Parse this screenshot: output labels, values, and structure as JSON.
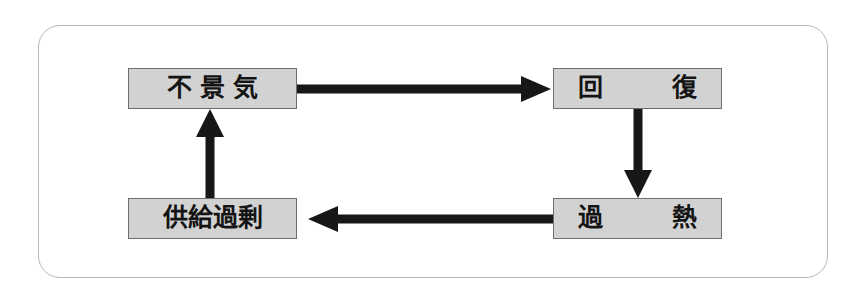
{
  "diagram": {
    "title": "",
    "type": "cycle-flowchart",
    "frame": {
      "shape": "rounded-rectangle",
      "border_color": "#b9b9b9"
    },
    "colors": {
      "node_fill": "#d2d2d2",
      "node_border": "#6e6e6e",
      "arrow": "#171717",
      "text": "#141414",
      "background": "#ffffff"
    },
    "nodes": [
      {
        "id": "recession",
        "label": "不景気",
        "position": "top-left"
      },
      {
        "id": "recovery",
        "label": "回　復",
        "position": "top-right"
      },
      {
        "id": "overheat",
        "label": "過　熱",
        "position": "bottom-right"
      },
      {
        "id": "oversupply",
        "label": "供給過剰",
        "position": "bottom-left"
      }
    ],
    "edges": [
      {
        "id": "edge-recession-to-recovery",
        "from": "recession",
        "to": "recovery",
        "direction": "right"
      },
      {
        "id": "edge-recovery-to-overheat",
        "from": "recovery",
        "to": "overheat",
        "direction": "down"
      },
      {
        "id": "edge-overheat-to-oversupply",
        "from": "overheat",
        "to": "oversupply",
        "direction": "left"
      },
      {
        "id": "edge-oversupply-to-recession",
        "from": "oversupply",
        "to": "recession",
        "direction": "up"
      }
    ]
  }
}
